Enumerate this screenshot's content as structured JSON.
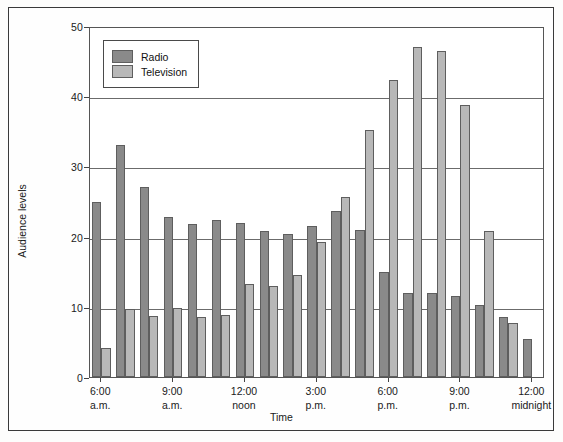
{
  "chart_data": {
    "type": "bar",
    "title": "",
    "xlabel": "Time",
    "ylabel": "Audience levels",
    "ylim": [
      0,
      50
    ],
    "yticks": [
      0,
      10,
      20,
      30,
      40,
      50
    ],
    "grid": true,
    "legend_position": "top-left",
    "categories": [
      "6:00 a.m.",
      "7:00 a.m.",
      "8:00 a.m.",
      "9:00 a.m.",
      "10:00 a.m.",
      "11:00 a.m.",
      "12:00 noon",
      "1:00 p.m.",
      "2:00 p.m.",
      "3:00 p.m.",
      "4:00 p.m.",
      "5:00 p.m.",
      "6:00 p.m.",
      "7:00 p.m.",
      "8:00 p.m.",
      "9:00 p.m.",
      "10:00 p.m.",
      "11:00 p.m.",
      "12:00 midnight"
    ],
    "series": [
      {
        "name": "Radio",
        "color": "#8a8a8a",
        "values": [
          25,
          33,
          27,
          22.8,
          21.8,
          22.3,
          22,
          20.8,
          20.4,
          21.5,
          23.7,
          21,
          15,
          12,
          12,
          11.5,
          10.3,
          8.6,
          5.4
        ]
      },
      {
        "name": "Television",
        "color": "#b8b8b8",
        "values": [
          4.2,
          9.7,
          8.7,
          9.8,
          8.5,
          8.8,
          13.2,
          12.9,
          14.6,
          19.2,
          25.6,
          35.2,
          42.3,
          47,
          46.4,
          38.7,
          20.8,
          7.7,
          0
        ]
      }
    ],
    "xtick_labels": [
      {
        "time": "6:00",
        "period": "a.m.",
        "index": 0
      },
      {
        "time": "9:00",
        "period": "a.m.",
        "index": 3
      },
      {
        "time": "12:00",
        "period": "noon",
        "index": 6
      },
      {
        "time": "3:00",
        "period": "p.m.",
        "index": 9
      },
      {
        "time": "6:00",
        "period": "p.m.",
        "index": 12
      },
      {
        "time": "9:00",
        "period": "p.m.",
        "index": 15
      },
      {
        "time": "12:00",
        "period": "midnight",
        "index": 18
      }
    ]
  },
  "legend": {
    "entries": [
      {
        "label": "Radio",
        "swatch": "radio"
      },
      {
        "label": "Television",
        "swatch": "television"
      }
    ]
  },
  "axes": {
    "y_title": "Audience levels",
    "x_title": "Time",
    "y_tick_texts": [
      "0",
      "10",
      "20",
      "30",
      "40",
      "50"
    ]
  }
}
